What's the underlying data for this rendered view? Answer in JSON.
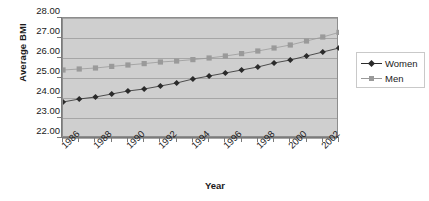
{
  "chart_data": {
    "type": "line",
    "title": "",
    "xlabel": "Year",
    "ylabel": "Average BMI",
    "x": [
      1986,
      1987,
      1988,
      1989,
      1990,
      1991,
      1992,
      1993,
      1994,
      1995,
      1996,
      1997,
      1998,
      1999,
      2000,
      2001,
      2002,
      2003
    ],
    "categories": [
      "1986",
      "1987",
      "1988",
      "1989",
      "1990",
      "1991",
      "1992",
      "1993",
      "1994",
      "1995",
      "1996",
      "1997",
      "1998",
      "1999",
      "2000",
      "2001",
      "2002",
      "2003"
    ],
    "xtick_labels": [
      "1986",
      "1988",
      "1990",
      "1992",
      "1994",
      "1996",
      "1998",
      "2000",
      "2002"
    ],
    "xtick_values": [
      1986,
      1988,
      1990,
      1992,
      1994,
      1996,
      1998,
      2000,
      2002
    ],
    "ytick_labels": [
      "22.00",
      "23.00",
      "24.00",
      "25.00",
      "26.00",
      "27.00",
      "28.00"
    ],
    "ytick_values": [
      22,
      23,
      24,
      25,
      26,
      27,
      28
    ],
    "ylim": [
      22,
      28
    ],
    "xlim": [
      1986,
      2003
    ],
    "grid": true,
    "legend_position": "right",
    "plot_background": "#cfcfcf",
    "series": [
      {
        "name": "Women",
        "marker": "diamond",
        "color": "#2b2b2b",
        "values": [
          23.8,
          23.95,
          24.05,
          24.2,
          24.35,
          24.45,
          24.6,
          24.75,
          24.95,
          25.1,
          25.25,
          25.4,
          25.55,
          25.75,
          25.9,
          26.1,
          26.3,
          26.5
        ]
      },
      {
        "name": "Men",
        "marker": "square",
        "color": "#9a9a9a",
        "values": [
          25.4,
          25.45,
          25.5,
          25.58,
          25.65,
          25.72,
          25.8,
          25.85,
          25.92,
          26.0,
          26.1,
          26.22,
          26.35,
          26.5,
          26.65,
          26.85,
          27.05,
          27.28
        ]
      }
    ]
  },
  "legend": {
    "items": [
      {
        "label": "Women"
      },
      {
        "label": "Men"
      }
    ]
  }
}
